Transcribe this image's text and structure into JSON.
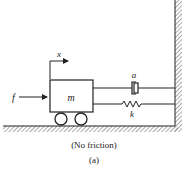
{
  "figure": {
    "caption": "(a)",
    "note": "(No friction)"
  },
  "labels": {
    "force": "f",
    "mass": "m",
    "displacement": "x",
    "damper": "a",
    "spring": "k"
  },
  "colors": {
    "ink": "#222222",
    "background": "#ffffff",
    "hatch": "#555555"
  }
}
